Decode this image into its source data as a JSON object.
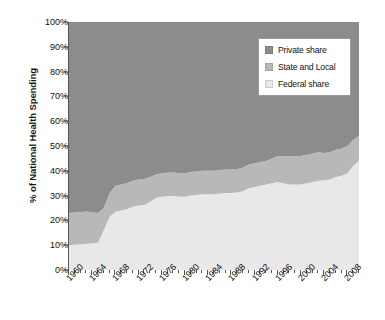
{
  "chart_data": {
    "type": "area",
    "stacked": true,
    "title": "",
    "subtitle": "",
    "xlabel": "",
    "ylabel": "% of National Health Spending",
    "xlim": [
      1960,
      2010
    ],
    "ylim": [
      0,
      100
    ],
    "grid": false,
    "legend_position": "top-right",
    "y_ticks": [
      0,
      10,
      20,
      30,
      40,
      50,
      60,
      70,
      80,
      90,
      100
    ],
    "y_tick_labels": [
      "0%",
      "10%",
      "20%",
      "30%",
      "40%",
      "50%",
      "60%",
      "70%",
      "80%",
      "90%",
      "100%"
    ],
    "x_ticks": [
      1960,
      1964,
      1968,
      1972,
      1976,
      1980,
      1984,
      1988,
      1992,
      1996,
      2000,
      2004,
      2008
    ],
    "x_tick_labels": [
      "1960",
      "1964",
      "1968",
      "1972",
      "1976",
      "1980",
      "1984",
      "1988",
      "1992",
      "1996",
      "2000",
      "2004",
      "2008"
    ],
    "x_minor_tick_step": 1,
    "x": [
      1960,
      1961,
      1962,
      1963,
      1964,
      1965,
      1966,
      1967,
      1968,
      1969,
      1970,
      1971,
      1972,
      1973,
      1974,
      1975,
      1976,
      1977,
      1978,
      1979,
      1980,
      1981,
      1982,
      1983,
      1984,
      1985,
      1986,
      1987,
      1988,
      1989,
      1990,
      1991,
      1992,
      1993,
      1994,
      1995,
      1996,
      1997,
      1998,
      1999,
      2000,
      2001,
      2002,
      2003,
      2004,
      2005,
      2006,
      2007,
      2008,
      2009,
      2010
    ],
    "series": [
      {
        "name": "Federal share",
        "color": "#e8e8e8",
        "values": [
          10.0,
          10.2,
          10.4,
          10.6,
          10.8,
          11.0,
          16.0,
          21.5,
          23.5,
          24.0,
          24.5,
          25.5,
          26.0,
          26.2,
          27.5,
          29.0,
          29.5,
          29.8,
          29.8,
          29.5,
          29.5,
          30.0,
          30.2,
          30.5,
          30.5,
          30.5,
          30.8,
          31.0,
          31.0,
          31.2,
          31.8,
          33.0,
          33.5,
          34.0,
          34.5,
          35.0,
          35.5,
          35.0,
          34.5,
          34.5,
          34.5,
          35.0,
          35.5,
          36.0,
          36.2,
          36.5,
          37.5,
          38.0,
          39.0,
          42.0,
          44.0
        ]
      },
      {
        "name": "State and Local",
        "color": "#b8b8b8",
        "values": [
          13.0,
          13.0,
          13.0,
          13.0,
          12.5,
          12.0,
          9.0,
          9.5,
          10.5,
          10.5,
          10.5,
          10.5,
          10.5,
          10.5,
          10.0,
          9.5,
          9.5,
          9.5,
          9.5,
          9.5,
          9.5,
          9.5,
          9.5,
          9.5,
          9.5,
          9.5,
          9.5,
          9.5,
          9.5,
          9.5,
          9.5,
          9.5,
          9.5,
          9.5,
          9.5,
          10.0,
          10.5,
          11.0,
          11.5,
          11.5,
          11.5,
          11.5,
          11.5,
          11.5,
          11.0,
          11.0,
          11.0,
          11.0,
          11.0,
          10.5,
          10.0
        ]
      },
      {
        "name": "Private share",
        "color": "#8c8c8c",
        "values": [
          77.0,
          76.8,
          76.6,
          76.4,
          76.7,
          77.0,
          75.0,
          69.0,
          66.0,
          65.5,
          65.0,
          64.0,
          63.5,
          63.3,
          62.5,
          61.5,
          61.0,
          60.7,
          60.7,
          61.0,
          61.0,
          60.5,
          60.3,
          60.0,
          60.0,
          60.0,
          59.7,
          59.5,
          59.5,
          59.3,
          58.7,
          57.5,
          57.0,
          56.5,
          56.0,
          55.0,
          54.0,
          54.0,
          54.0,
          54.0,
          54.0,
          53.5,
          53.0,
          52.5,
          52.8,
          52.5,
          51.5,
          51.0,
          50.0,
          47.5,
          46.0
        ]
      }
    ]
  },
  "legend": {
    "items": [
      {
        "label": "Private share",
        "color": "#8c8c8c"
      },
      {
        "label": "State and Local",
        "color": "#b8b8b8"
      },
      {
        "label": "Federal share",
        "color": "#e8e8e8"
      }
    ]
  },
  "axis": {
    "y_title": "% of National Health Spending"
  }
}
